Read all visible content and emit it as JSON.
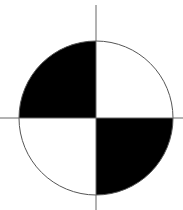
{
  "diagram": {
    "type": "center-of-mass-symbol",
    "center": {
      "x": 96,
      "y": 118
    },
    "radius": 77,
    "colors": {
      "fill": "#000000",
      "background": "#ffffff",
      "stroke": "#555555"
    },
    "quadrants": [
      {
        "position": "top-left",
        "fill": "#000000"
      },
      {
        "position": "top-right",
        "fill": "#ffffff"
      },
      {
        "position": "bottom-left",
        "fill": "#ffffff"
      },
      {
        "position": "bottom-right",
        "fill": "#000000"
      }
    ],
    "crosshair": {
      "vertical": {
        "x": 96,
        "y1": 5,
        "y2": 210
      },
      "horizontal": {
        "y": 118,
        "x1": 0,
        "x2": 183
      }
    }
  }
}
